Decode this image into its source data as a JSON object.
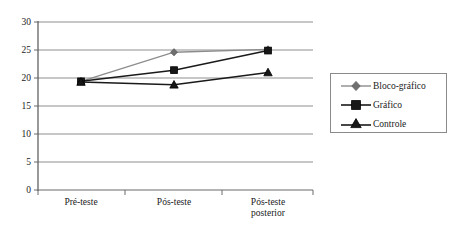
{
  "chart_data": {
    "type": "line",
    "title": "",
    "xlabel": "",
    "ylabel": "",
    "categories": [
      "Pré-teste",
      "Pós-teste",
      "Pós-teste posterior"
    ],
    "category_lines": [
      [
        "Pré-teste"
      ],
      [
        "Pós-teste"
      ],
      [
        "Pós-teste",
        "posterior"
      ]
    ],
    "ylim": [
      0,
      30
    ],
    "ytick_step": 5,
    "yticks": [
      "0",
      "5",
      "10",
      "15",
      "20",
      "25",
      "30"
    ],
    "grid": "horizontal",
    "legend_position": "right",
    "series": [
      {
        "name": "Bloco-gráfico",
        "marker": "diamond",
        "color": "#8c8c8c",
        "values": [
          19.4,
          24.6,
          25.1
        ]
      },
      {
        "name": "Gráfico",
        "marker": "square",
        "color": "#1a1a1a",
        "values": [
          19.4,
          21.4,
          24.9
        ]
      },
      {
        "name": "Controle",
        "marker": "triangle",
        "color": "#1a1a1a",
        "values": [
          19.3,
          18.8,
          21.0
        ]
      }
    ]
  },
  "legend": {
    "items": [
      {
        "label": "Bloco-gráfico"
      },
      {
        "label": "Gráfico"
      },
      {
        "label": "Controle"
      }
    ]
  },
  "axis": {
    "y_labels": [
      "30",
      "25",
      "20",
      "15",
      "10",
      "5",
      "0"
    ],
    "x_labels": [
      "Pré-teste",
      "Pós-teste",
      "Pós-teste posterior"
    ]
  }
}
